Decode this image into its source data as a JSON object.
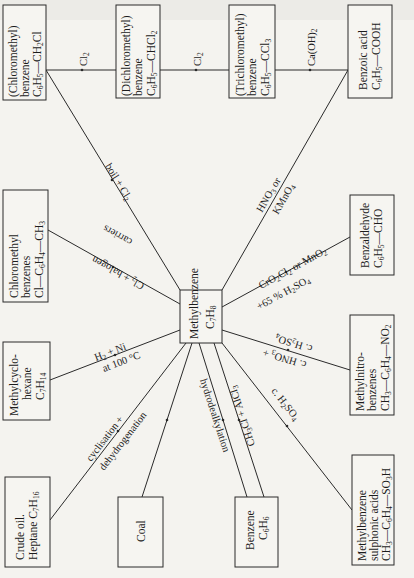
{
  "diagram": {
    "center": {
      "name": "Methylbenzene",
      "formula": "C7H8"
    },
    "top_chain": [
      {
        "name": "(Chloromethyl) benzene",
        "line1": "(Chloromethyl)",
        "line2": "benzene",
        "formula": "C6H5—CH2Cl"
      },
      {
        "name": "(Dichloromethyl) benzene",
        "line1": "(Dichloromethyl)",
        "line2": "benzene",
        "formula": "C6H5—CHCl2"
      },
      {
        "name": "(Trichloromethyl) benzene",
        "line1": "(Trichloromethyl)",
        "line2": "benzene",
        "formula": "C6H5—CCl3"
      },
      {
        "name": "Benzoic acid",
        "line1": "Benzoic acid",
        "formula": "C6H5—COOH"
      }
    ],
    "chain_reagents": [
      "Cl2",
      "Cl2",
      "Ca(OH)2"
    ],
    "products": [
      {
        "id": "chloromethylbenzenes",
        "line1": "Chloromethyl",
        "line2": "benzenes",
        "formula": "Cl—C6H4—CH3",
        "reagent_1": "Cl2 + halogen",
        "reagent_2": "carriers"
      },
      {
        "id": "benzaldehyde",
        "line1": "Benzaldehyde",
        "formula": "C6H5—CHO",
        "reagent_1": "CrO2Cl2 or MnO2",
        "reagent_2": "+65 % H2SO4"
      },
      {
        "id": "methylnitrobenzenes",
        "line1": "Methylnitro-",
        "line2": "benzenes",
        "formula": "CH3—C6H4—NO2",
        "reagent_1": "c. H2SO4",
        "reagent_2": "c. HNO3 +"
      },
      {
        "id": "methylbenzenesulphonic",
        "line1": "Methylbenzene",
        "line2": "sulphonic acids",
        "formula": "CH3—C6H4—SO3H",
        "reagent_1": "c. H2SO4"
      },
      {
        "id": "methylcyclohexane",
        "line1": "Methylcyclo-",
        "line2": "hexane",
        "formula": "C7H14",
        "reagent_1": "H2 + Ni",
        "reagent_2": "at 100 °C"
      }
    ],
    "oxidation": {
      "reagent_1": "HNO3 or",
      "reagent_2": "KMnO4"
    },
    "side_chain_chlorination": {
      "reagent": "boil + Cl2"
    },
    "sources": [
      {
        "id": "crude-oil",
        "line1": "Crude oil.",
        "line2": "Heptane C7H16",
        "reagent_1": "cyclisation +",
        "reagent_2": "dehydrogenation"
      },
      {
        "id": "coal",
        "line1": "Coal"
      },
      {
        "id": "benzene",
        "line1": "Benzene",
        "formula": "C6H6",
        "reagent_forward": "CH3Cl + AlCl3",
        "reagent_back": "hydrodealkylation"
      }
    ]
  }
}
